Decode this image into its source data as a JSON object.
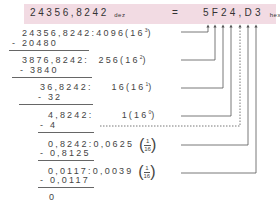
{
  "header": {
    "decimal_value": "24356,8242",
    "decimal_subscript": "dez",
    "equals": "=",
    "hex_value": "5F24,D3",
    "hex_subscript": "hex"
  },
  "steps": [
    {
      "dividend": "24356,8242",
      "sep": ":",
      "divisor": "4096",
      "power": "(16",
      "exp": "3",
      "close": ")",
      "subtract": "- 20480"
    },
    {
      "dividend": "3876,8242",
      "sep": ":",
      "divisor": "256",
      "power": "(16",
      "exp": "2",
      "close": ")",
      "subtract": "- 3840"
    },
    {
      "dividend": "36,8242",
      "sep": ":",
      "divisor": "16",
      "power": "(16",
      "exp": "1",
      "close": ")",
      "subtract": "- 32"
    },
    {
      "dividend": "4,8242",
      "sep": ":",
      "divisor": "1",
      "power": "(16",
      "exp": "0",
      "close": ")",
      "subtract": "- 4"
    },
    {
      "dividend": "0,8242",
      "sep": ":",
      "divisor": "0,0625",
      "frac_num": "1",
      "frac_den": "16",
      "subtract": "- 0,8125"
    },
    {
      "dividend": "0,0117",
      "sep": ":",
      "divisor": "0,0039",
      "frac_num": "1",
      "frac_den": "16",
      "subtract": "- 0,0117"
    }
  ],
  "remainder": "0",
  "colors": {
    "header_bg": "#f2dbe3",
    "line": "#555555"
  }
}
